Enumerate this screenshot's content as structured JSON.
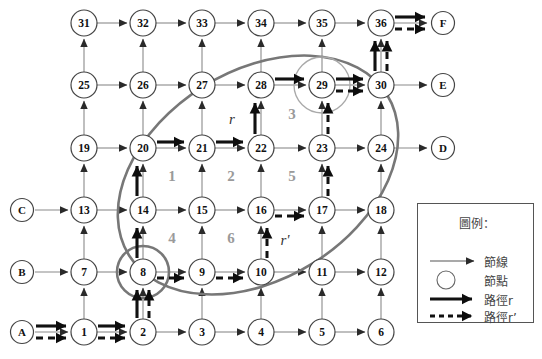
{
  "figure": {
    "type": "network-grid-diagram",
    "width": 542,
    "height": 359,
    "background": "#ffffff",
    "colors": {
      "arc": "#8a8a8a",
      "node_stroke": "#444444",
      "node_fill": "#ffffff",
      "path_r": "#111111",
      "path_rp": "#111111",
      "ellipse": "#777777",
      "circle_node8": "#777777",
      "circle_node29": "#a9a9a9",
      "region_label": "#9a9a9a",
      "legend_border": "#555555",
      "legend_text": "#444444"
    }
  },
  "grid": {
    "columns_x": [
      84,
      143,
      202,
      261,
      322,
      381
    ],
    "rows_y": [
      23,
      85,
      148,
      210,
      272,
      332
    ],
    "node_radius": 13,
    "rows": [
      {
        "labels": [
          "31",
          "32",
          "33",
          "34",
          "35",
          "36"
        ]
      },
      {
        "labels": [
          "25",
          "26",
          "27",
          "28",
          "29",
          "30"
        ]
      },
      {
        "labels": [
          "19",
          "20",
          "21",
          "22",
          "23",
          "24"
        ]
      },
      {
        "labels": [
          "13",
          "14",
          "15",
          "16",
          "17",
          "18"
        ]
      },
      {
        "labels": [
          "7",
          "8",
          "9",
          "10",
          "11",
          "12"
        ]
      },
      {
        "labels": [
          "1",
          "2",
          "3",
          "4",
          "5",
          "6"
        ]
      }
    ]
  },
  "terminals": {
    "left": [
      {
        "label": "C",
        "x": 22,
        "y": 210
      },
      {
        "label": "B",
        "x": 22,
        "y": 272
      },
      {
        "label": "A",
        "x": 22,
        "y": 332
      }
    ],
    "right": [
      {
        "label": "F",
        "x": 443,
        "y": 23
      },
      {
        "label": "E",
        "x": 443,
        "y": 85
      },
      {
        "label": "D",
        "x": 443,
        "y": 148
      }
    ]
  },
  "region_labels": [
    {
      "text": "1",
      "x": 172,
      "y": 181
    },
    {
      "text": "2",
      "x": 231,
      "y": 181
    },
    {
      "text": "5",
      "x": 292,
      "y": 181
    },
    {
      "text": "3",
      "x": 292,
      "y": 119
    },
    {
      "text": "4",
      "x": 172,
      "y": 243
    },
    {
      "text": "6",
      "x": 231,
      "y": 243
    }
  ],
  "path_labels": [
    {
      "text": "r",
      "x": 232,
      "y": 124
    },
    {
      "text": "r'",
      "x": 285,
      "y": 245
    }
  ],
  "paths": {
    "r": {
      "name": "path-r",
      "style": "solid-bold",
      "nodes": [
        "A",
        "1",
        "2",
        "8",
        "14",
        "20",
        "21",
        "22",
        "28",
        "29",
        "30",
        "36",
        "F"
      ]
    },
    "r_prime": {
      "name": "path-r-prime",
      "style": "dashed-bold",
      "nodes": [
        "A",
        "1",
        "2",
        "8",
        "9",
        "10",
        "16",
        "17",
        "23",
        "29",
        "30",
        "36",
        "F"
      ]
    }
  },
  "highlight_shapes": {
    "ellipse": {
      "cx": 258,
      "cy": 175,
      "rx": 152,
      "ry": 104,
      "rotate": -32
    },
    "circle_node8": {
      "cx": 143,
      "cy": 272,
      "r": 26
    },
    "circle_node29": {
      "cx": 322,
      "cy": 85,
      "r": 28
    }
  },
  "legend": {
    "x": 417,
    "y": 203,
    "width": 117,
    "height": 120,
    "title": "圖例：",
    "items": [
      {
        "key": "arc",
        "symbol": "thin-arrow",
        "label": "節線"
      },
      {
        "key": "node",
        "symbol": "circle",
        "label": "節點"
      },
      {
        "key": "path_r",
        "symbol": "bold-arrow",
        "label": "路徑r"
      },
      {
        "key": "path_rp",
        "symbol": "dashed-arrow",
        "label": "路徑r’"
      }
    ]
  }
}
